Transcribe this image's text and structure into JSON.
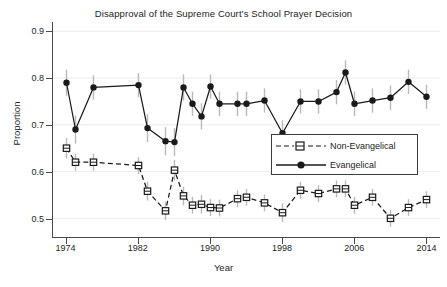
{
  "chart_data": {
    "type": "line",
    "title": "Disapproval of the Supreme Court’s School Prayer Decision",
    "xlabel": "Year",
    "ylabel": "Proportion",
    "xlim": [
      1972.5,
      2015.5
    ],
    "ylim": [
      0.46,
      0.92
    ],
    "xticks": [
      1974,
      1982,
      1990,
      1998,
      2006,
      2014
    ],
    "yticks": [
      0.5,
      0.6,
      0.7,
      0.8,
      0.9
    ],
    "grid": "light horizontal gridlines at y ticks",
    "legend_position": "center-right inside axes",
    "error_bars": "vertical 95% confidence intervals, light gray",
    "series": [
      {
        "name": "Evangelical",
        "marker": "filled-circle",
        "line": "solid",
        "color": "#1a1a1a",
        "x": [
          1974,
          1975,
          1977,
          1982,
          1983,
          1985,
          1986,
          1987,
          1988,
          1989,
          1990,
          1991,
          1993,
          1994,
          1996,
          1998,
          2000,
          2002,
          2004,
          2005,
          2006,
          2008,
          2010,
          2012,
          2014
        ],
        "y": [
          0.79,
          0.69,
          0.78,
          0.785,
          0.693,
          0.665,
          0.663,
          0.78,
          0.745,
          0.718,
          0.782,
          0.745,
          0.745,
          0.745,
          0.752,
          0.682,
          0.75,
          0.75,
          0.77,
          0.812,
          0.745,
          0.752,
          0.758,
          0.792,
          0.76
        ]
      },
      {
        "name": "Non-Evangelical",
        "marker": "open-square",
        "line": "dashed",
        "color": "#1a1a1a",
        "x": [
          1974,
          1975,
          1977,
          1982,
          1983,
          1985,
          1986,
          1987,
          1988,
          1989,
          1990,
          1991,
          1993,
          1994,
          1996,
          1998,
          2000,
          2002,
          2004,
          2005,
          2006,
          2008,
          2010,
          2012,
          2014
        ],
        "y": [
          0.65,
          0.62,
          0.62,
          0.613,
          0.558,
          0.516,
          0.603,
          0.548,
          0.528,
          0.53,
          0.523,
          0.522,
          0.542,
          0.545,
          0.533,
          0.512,
          0.56,
          0.553,
          0.563,
          0.563,
          0.528,
          0.545,
          0.5,
          0.523,
          0.54
        ]
      }
    ],
    "error_bar_halfwidth": {
      "Evangelical": [
        0.028,
        0.03,
        0.026,
        0.026,
        0.03,
        0.03,
        0.03,
        0.028,
        0.026,
        0.028,
        0.026,
        0.026,
        0.026,
        0.026,
        0.026,
        0.028,
        0.026,
        0.026,
        0.026,
        0.026,
        0.026,
        0.026,
        0.026,
        0.026,
        0.026
      ],
      "Non-Evangelical": [
        0.022,
        0.018,
        0.018,
        0.018,
        0.02,
        0.02,
        0.022,
        0.02,
        0.018,
        0.02,
        0.018,
        0.018,
        0.018,
        0.018,
        0.018,
        0.02,
        0.018,
        0.018,
        0.018,
        0.018,
        0.018,
        0.018,
        0.018,
        0.018,
        0.018
      ]
    }
  },
  "axes": {
    "y_tick_labels": [
      "0.9",
      "0.8",
      "0.7",
      "0.6",
      "0.5"
    ],
    "x_tick_labels": [
      "1974",
      "1982",
      "1990",
      "1998",
      "2006",
      "2014"
    ]
  },
  "legend": {
    "items": [
      {
        "label": "Non-Evangelical"
      },
      {
        "label": "Evangelical"
      }
    ]
  }
}
